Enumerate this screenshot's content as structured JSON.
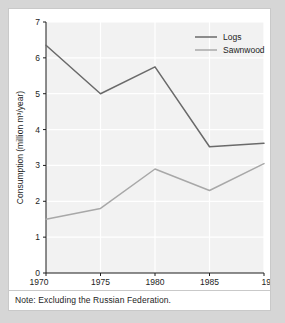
{
  "figure": {
    "note": "Note: Excluding the Russian Federation."
  },
  "colors": {
    "logs": "#6a6a6a",
    "sawnwood": "#a8a8a8",
    "plot_background": "#f2f2f2",
    "gridline": "#ffffff",
    "axis": "#1d1d1d",
    "panel_background": "#ffffff",
    "page_background": "#d6d6d6"
  },
  "chart_data": {
    "type": "line",
    "title": "",
    "xlabel": "",
    "ylabel": "Consumption (million m³/year)",
    "x": [
      1970,
      1975,
      1980,
      1985,
      1990
    ],
    "xtick_labels": [
      "1970",
      "1975",
      "1980",
      "1985",
      "1990"
    ],
    "ytick_labels": [
      "0",
      "1",
      "2",
      "3",
      "4",
      "5",
      "6",
      "7"
    ],
    "ytick_values": [
      0,
      1,
      2,
      3,
      4,
      5,
      6,
      7
    ],
    "ylim": [
      0,
      7
    ],
    "xlim": [
      1970,
      1990
    ],
    "grid": true,
    "legend_position": "top-right",
    "series": [
      {
        "name": "Logs",
        "values": [
          6.35,
          5.0,
          5.75,
          3.52,
          3.62
        ]
      },
      {
        "name": "Sawnwood",
        "values": [
          1.5,
          1.8,
          2.9,
          2.3,
          3.05
        ]
      }
    ]
  }
}
